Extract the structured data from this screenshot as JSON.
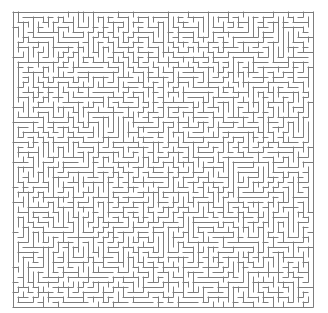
{
  "figure": {
    "kind": "maze-puzzle",
    "title": "",
    "width_px": 328,
    "height_px": 313,
    "background_color": "#ffffff"
  },
  "maze": {
    "name": "rectangular-perfect-maze",
    "columns": 60,
    "rows": 59,
    "cell_size_px": 5,
    "origin_x_px": 13,
    "origin_y_px": 12,
    "wall_color": "#7d7d7d",
    "wall_thickness_px": 1,
    "passage_color": "#ffffff",
    "border": "closed",
    "algorithm": "depth-first-search",
    "seed": 20240517,
    "entrance": "none-visible",
    "exit": "none-visible"
  },
  "artifacts": {
    "left_edge_mark": {
      "name": "left-edge-clipped-mark",
      "x_px": 0,
      "y_px": 12,
      "width_px": 4,
      "height_px": 16,
      "color": "#9a9a9a"
    }
  }
}
